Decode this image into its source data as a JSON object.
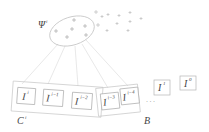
{
  "diagram": {
    "cluster_label": "Ψ",
    "cluster_label_sup": "i",
    "clip_label": "C",
    "clip_label_sup": "i",
    "buffer_label": "B",
    "ellipsis": "· · ·",
    "frames": [
      {
        "base": "I",
        "sup": "i"
      },
      {
        "base": "I",
        "sup": "i−1"
      },
      {
        "base": "I",
        "sup": "i−2"
      },
      {
        "base": "I",
        "sup": "i−3"
      },
      {
        "base": "I",
        "sup": "i−4"
      },
      {
        "base": "I",
        "sup": "1"
      },
      {
        "base": "I",
        "sup": "0"
      }
    ],
    "colors": {
      "stroke": "#bdbdbd",
      "text": "#444444",
      "plus": "#9e9e9e"
    }
  }
}
